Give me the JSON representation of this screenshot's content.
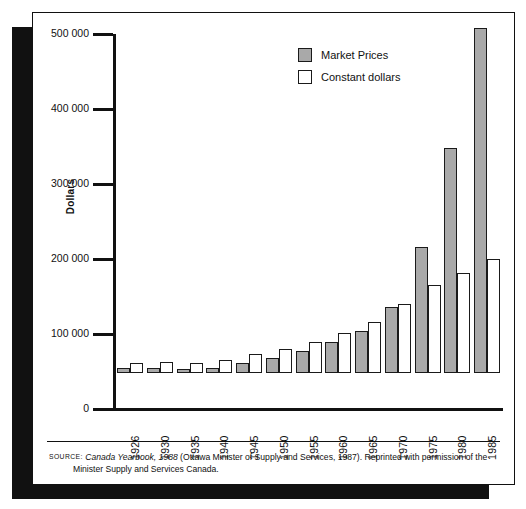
{
  "figure": {
    "y_axis_title": "Dollars",
    "source_label": "SOURCE:",
    "source_italic": "Canada Yearbook, 1988",
    "source_rest": " (Ottawa Minister of Supply and Services, 1987). Reprinted with permission of the",
    "source_line2": "Minister Supply and Services Canada."
  },
  "legend": {
    "items": [
      {
        "label": "Market Prices",
        "swatch": "gray-filled-square",
        "color": "#a9a9a9"
      },
      {
        "label": "Constant dollars",
        "swatch": "white-outlined-square",
        "color": "#ffffff"
      }
    ]
  },
  "chart_data": {
    "type": "bar",
    "title": "",
    "xlabel": "",
    "ylabel": "Dollars",
    "ylim": [
      0,
      500000
    ],
    "ytick_labels": [
      "500 000",
      "400 000",
      "300 000",
      "200 000",
      "100 000",
      "0"
    ],
    "ytick_values": [
      500000,
      400000,
      300000,
      200000,
      100000,
      0
    ],
    "grid": false,
    "legend_position": "upper-center",
    "categories": [
      "1926",
      "1930",
      "1935",
      "1940",
      "1945",
      "1950",
      "1955",
      "1960",
      "1965",
      "1970",
      "1975",
      "1980",
      "1985"
    ],
    "series": [
      {
        "name": "Market Prices",
        "color": "#a9a9a9",
        "values": [
          7000,
          7000,
          6000,
          7000,
          13000,
          20000,
          30000,
          41000,
          56000,
          88000,
          168000,
          300000,
          460000
        ]
      },
      {
        "name": "Constant dollars",
        "color": "#ffffff",
        "values": [
          14000,
          15000,
          14000,
          18000,
          25000,
          32000,
          42000,
          54000,
          68000,
          92000,
          117000,
          134000,
          152000
        ]
      }
    ]
  }
}
